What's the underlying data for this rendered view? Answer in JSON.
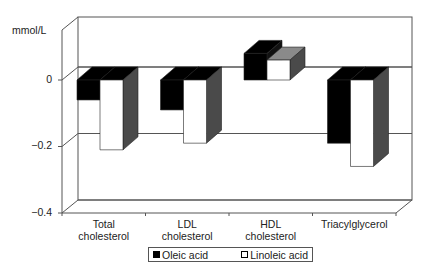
{
  "chart_data": {
    "type": "bar",
    "style": "3d-clustered-column",
    "title": "",
    "xlabel": "",
    "ylabel": "mmol/L",
    "ylim": [
      -0.4,
      0.0
    ],
    "yticks": [
      "0",
      "-0.2",
      "-0.4"
    ],
    "ytick_values": [
      0,
      -0.2,
      -0.4
    ],
    "grid": true,
    "legend_position": "bottom",
    "categories": [
      "Total cholesterol",
      "LDL cholesterol",
      "HDL cholesterol",
      "Triacylglycerol"
    ],
    "category_lines": [
      [
        "Total",
        "cholesterol"
      ],
      [
        "LDL",
        "cholesterol"
      ],
      [
        "HDL",
        "cholesterol"
      ],
      [
        "Triacylglycerol"
      ]
    ],
    "series": [
      {
        "name": "Oleic acid",
        "color": "#000000",
        "values": [
          -0.06,
          -0.09,
          0.08,
          -0.19
        ]
      },
      {
        "name": "Linoleic acid",
        "color": "#ffffff",
        "values": [
          -0.21,
          -0.19,
          0.06,
          -0.26
        ]
      }
    ]
  },
  "axis": {
    "ylabel": "mmol/L",
    "tick_0": "0",
    "tick_m02": "−0.2",
    "tick_m04": "−0.4"
  },
  "legend": {
    "oleic": "Oleic acid",
    "linoleic": "Linoleic acid",
    "oleic_color": "#000000",
    "linoleic_color": "#ffffff"
  },
  "colors": {
    "axis": "#555555",
    "side_shade": "#4a4a4a",
    "top_shade_light": "#8a8a8a"
  }
}
